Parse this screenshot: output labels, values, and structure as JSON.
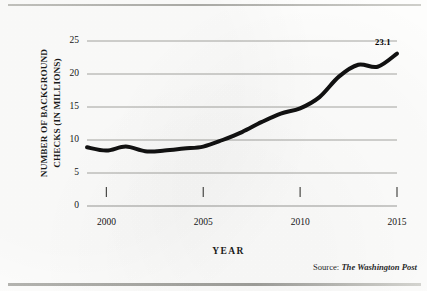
{
  "figure": {
    "source_prefix": "Source:",
    "source_name": "The Washington Post"
  },
  "chart_data": {
    "type": "line",
    "title": "",
    "xlabel": "YEAR",
    "ylabel": "NUMBER OF BACKGROUND CHECKS (IN MILLIONS)",
    "ylabel_line1": "NUMBER OF BACKGROUND",
    "ylabel_line2": "CHECKS (IN MILLIONS)",
    "xlim": [
      1999,
      2015
    ],
    "ylim": [
      0,
      25
    ],
    "yticks": [
      0,
      5,
      10,
      15,
      20,
      25
    ],
    "ytick_labels": [
      "0",
      "5",
      "10",
      "15",
      "20",
      "25"
    ],
    "xticks": [
      2000,
      2005,
      2010,
      2015
    ],
    "xtick_labels": [
      "2000",
      "2005",
      "2010",
      "2015"
    ],
    "grid": "horizontal",
    "legend": "none",
    "line_color": "#111111",
    "line_width": 4,
    "x": [
      1999,
      2000,
      2001,
      2002,
      2003,
      2004,
      2005,
      2006,
      2007,
      2008,
      2009,
      2010,
      2011,
      2012,
      2013,
      2014,
      2015
    ],
    "values": [
      8.9,
      8.4,
      9.0,
      8.3,
      8.4,
      8.7,
      9.0,
      10.0,
      11.2,
      12.7,
      14.0,
      14.8,
      16.5,
      19.6,
      21.4,
      21.1,
      23.1
    ],
    "annotations": [
      {
        "label": "23.1",
        "x": 2015,
        "y": 23.1
      }
    ]
  }
}
